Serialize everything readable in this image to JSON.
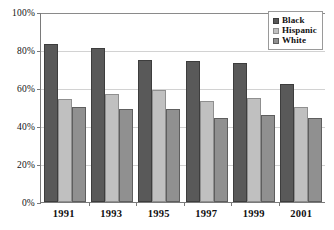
{
  "chart_data": {
    "type": "bar",
    "title": "",
    "subtitle": "",
    "xlabel": "",
    "ylabel": "",
    "categories": [
      "1991",
      "1993",
      "1995",
      "1997",
      "1999",
      "2001"
    ],
    "series": [
      {
        "name": "Black",
        "color": "#595959",
        "values": [
          83,
          81,
          75,
          74,
          73,
          62
        ]
      },
      {
        "name": "Hispanic",
        "color": "#c0c0c0",
        "values": [
          54,
          57,
          59,
          53,
          55,
          50
        ]
      },
      {
        "name": "White",
        "color": "#909090",
        "values": [
          50,
          49,
          49,
          44,
          46,
          44
        ]
      }
    ],
    "ylim": [
      0,
      100
    ],
    "ytick_values": [
      0,
      20,
      40,
      60,
      80,
      100
    ],
    "ytick_labels": [
      "0%",
      "20%",
      "40%",
      "60%",
      "80%",
      "100%"
    ],
    "grid": "horizontal",
    "legend_position": "top-right",
    "annotations": []
  }
}
